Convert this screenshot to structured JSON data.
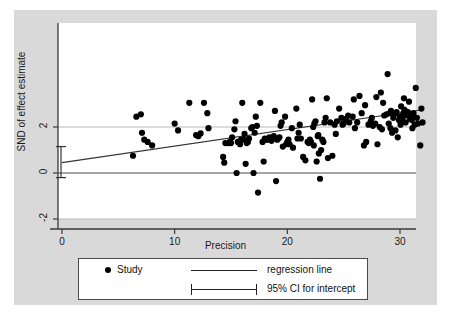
{
  "figure": {
    "background_color": "#d9d9d9",
    "plot_background_color": "#ffffff"
  },
  "chart_data": {
    "type": "scatter",
    "title": "",
    "xlabel": "Precision",
    "ylabel": "SND of effect estimate",
    "xlim": [
      -1.2,
      32.5
    ],
    "ylim": [
      -2.6,
      4.6
    ],
    "xticks": [
      0,
      10,
      20,
      30
    ],
    "xtick_labels": [
      "0",
      "10",
      "20",
      "30"
    ],
    "yticks": [
      2,
      0,
      -2
    ],
    "ytick_labels": [
      "2",
      "0",
      "-2"
    ],
    "grid": true,
    "gridlines_y": [
      2,
      -2
    ],
    "zero_line_y": 0,
    "legend_position": "below-axes",
    "series": [
      {
        "name": "Study",
        "marker": "filled-circle",
        "color": "#000000",
        "points": [
          [
            6.3,
            0.75
          ],
          [
            6.6,
            2.45
          ],
          [
            7.0,
            2.55
          ],
          [
            7.1,
            1.75
          ],
          [
            7.3,
            1.45
          ],
          [
            7.6,
            1.35
          ],
          [
            8.0,
            1.2
          ],
          [
            10.0,
            2.15
          ],
          [
            10.3,
            1.85
          ],
          [
            11.3,
            3.05
          ],
          [
            11.9,
            1.65
          ],
          [
            12.1,
            1.6
          ],
          [
            12.3,
            1.72
          ],
          [
            12.6,
            3.05
          ],
          [
            12.9,
            2.6
          ],
          [
            13.0,
            1.95
          ],
          [
            14.3,
            0.7
          ],
          [
            14.4,
            0.45
          ],
          [
            14.5,
            1.3
          ],
          [
            14.8,
            1.3
          ],
          [
            15.0,
            1.3
          ],
          [
            15.1,
            1.55
          ],
          [
            15.3,
            1.9
          ],
          [
            15.4,
            2.25
          ],
          [
            15.5,
            0.0
          ],
          [
            15.6,
            1.35
          ],
          [
            15.8,
            1.25
          ],
          [
            16.0,
            3.05
          ],
          [
            16.1,
            1.45
          ],
          [
            16.2,
            1.7
          ],
          [
            16.3,
            0.4
          ],
          [
            16.5,
            1.35
          ],
          [
            16.6,
            1.5
          ],
          [
            16.8,
            1.95
          ],
          [
            16.9,
            2.0
          ],
          [
            17.0,
            0.0
          ],
          [
            17.1,
            1.75
          ],
          [
            17.2,
            2.45
          ],
          [
            17.3,
            2.05
          ],
          [
            17.4,
            -0.85
          ],
          [
            17.6,
            3.05
          ],
          [
            17.8,
            1.35
          ],
          [
            17.9,
            0.5
          ],
          [
            18.0,
            1.5
          ],
          [
            18.2,
            1.45
          ],
          [
            18.4,
            1.55
          ],
          [
            18.6,
            1.4
          ],
          [
            18.8,
            1.6
          ],
          [
            18.9,
            2.7
          ],
          [
            19.0,
            -0.35
          ],
          [
            19.1,
            1.45
          ],
          [
            19.2,
            1.5
          ],
          [
            19.3,
            1.55
          ],
          [
            19.4,
            2.05
          ],
          [
            19.5,
            2.2
          ],
          [
            19.6,
            1.15
          ],
          [
            19.8,
            2.45
          ],
          [
            20.0,
            1.35
          ],
          [
            20.2,
            1.25
          ],
          [
            20.4,
            1.95
          ],
          [
            20.5,
            1.1
          ],
          [
            20.8,
            2.8
          ],
          [
            21.0,
            1.75
          ],
          [
            21.2,
            1.5
          ],
          [
            21.4,
            0.7
          ],
          [
            21.6,
            0.55
          ],
          [
            21.8,
            1.35
          ],
          [
            22.0,
            1.45
          ],
          [
            22.1,
            1.35
          ],
          [
            22.2,
            3.2
          ],
          [
            22.3,
            2.0
          ],
          [
            22.4,
            2.15
          ],
          [
            22.5,
            2.25
          ],
          [
            22.6,
            0.5
          ],
          [
            22.7,
            1.6
          ],
          [
            22.8,
            0.85
          ],
          [
            22.9,
            -0.25
          ],
          [
            23.0,
            1.0
          ],
          [
            23.2,
            1.35
          ],
          [
            23.4,
            2.4
          ],
          [
            23.6,
            0.65
          ],
          [
            23.8,
            2.2
          ],
          [
            24.0,
            0.75
          ],
          [
            24.2,
            2.1
          ],
          [
            24.4,
            2.25
          ],
          [
            24.6,
            2.8
          ],
          [
            24.8,
            2.4
          ],
          [
            25.0,
            2.15
          ],
          [
            25.2,
            2.35
          ],
          [
            25.4,
            2.5
          ],
          [
            25.5,
            2.2
          ],
          [
            25.8,
            2.45
          ],
          [
            26.0,
            1.95
          ],
          [
            26.2,
            2.2
          ],
          [
            26.4,
            3.35
          ],
          [
            26.6,
            2.6
          ],
          [
            26.8,
            1.2
          ],
          [
            27.0,
            1.35
          ],
          [
            27.2,
            2.1
          ],
          [
            27.4,
            2.25
          ],
          [
            27.5,
            2.4
          ],
          [
            27.6,
            2.05
          ],
          [
            27.8,
            2.15
          ],
          [
            28.0,
            1.25
          ],
          [
            28.2,
            2.0
          ],
          [
            28.3,
            3.5
          ],
          [
            28.5,
            3.05
          ],
          [
            28.6,
            2.5
          ],
          [
            28.8,
            2.55
          ],
          [
            28.9,
            4.3
          ],
          [
            29.0,
            2.15
          ],
          [
            29.1,
            2.6
          ],
          [
            29.2,
            2.7
          ],
          [
            29.3,
            1.75
          ],
          [
            29.4,
            2.4
          ],
          [
            29.5,
            2.55
          ],
          [
            29.6,
            1.85
          ],
          [
            29.7,
            2.65
          ],
          [
            29.8,
            1.55
          ],
          [
            29.9,
            2.3
          ],
          [
            30.0,
            2.45
          ],
          [
            30.1,
            2.9
          ],
          [
            30.2,
            2.35
          ],
          [
            30.3,
            2.6
          ],
          [
            30.4,
            2.75
          ],
          [
            30.5,
            2.2
          ],
          [
            30.6,
            2.5
          ],
          [
            30.7,
            2.65
          ],
          [
            30.8,
            3.1
          ],
          [
            30.9,
            2.35
          ],
          [
            31.0,
            2.45
          ],
          [
            31.1,
            1.95
          ],
          [
            31.2,
            2.6
          ],
          [
            31.3,
            2.1
          ],
          [
            31.4,
            3.7
          ],
          [
            31.5,
            2.4
          ],
          [
            31.6,
            2.15
          ],
          [
            31.8,
            1.2
          ],
          [
            31.9,
            2.8
          ],
          [
            32.0,
            2.2
          ],
          [
            23.5,
            3.25
          ],
          [
            25.9,
            3.2
          ],
          [
            27.9,
            3.3
          ],
          [
            30.35,
            3.25
          ],
          [
            26.9,
            2.95
          ],
          [
            24.9,
            2.1
          ],
          [
            21.1,
            2.1
          ],
          [
            20.1,
            1.45
          ],
          [
            18.1,
            1.45
          ],
          [
            16.4,
            1.3
          ],
          [
            15.9,
            1.45
          ],
          [
            14.9,
            1.35
          ],
          [
            23.1,
            1.45
          ],
          [
            22.35,
            1.2
          ],
          [
            21.9,
            1.3
          ],
          [
            19.9,
            1.25
          ],
          [
            28.4,
            1.9
          ],
          [
            29.15,
            1.95
          ],
          [
            31.05,
            2.3
          ],
          [
            30.05,
            2.1
          ],
          [
            23.3,
            2.2
          ],
          [
            24.3,
            1.7
          ],
          [
            22.75,
            1.65
          ],
          [
            20.9,
            1.5
          ]
        ]
      }
    ],
    "regression_line": {
      "name": "regression line",
      "color": "#333333",
      "x_start": 0,
      "y_start": 0.45,
      "x_end": 32.0,
      "y_end": 2.75
    },
    "intercept_ci": {
      "name": "95% CI for intercept",
      "x": 0,
      "center": 0.45,
      "lower": -0.2,
      "upper": 1.15
    }
  },
  "legend": {
    "study_label": "Study",
    "regression_label": "regression line",
    "ci_label": "95% CI for intercept"
  }
}
